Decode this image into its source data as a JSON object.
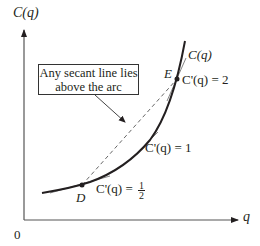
{
  "diagram": {
    "axes": {
      "y_label": "C(q)",
      "x_label": "q",
      "origin_label": "0"
    },
    "curve": {
      "label": "C(q)",
      "type": "convex cost curve"
    },
    "points": [
      {
        "name": "D",
        "slope_label_prefix": "C'(q) = ",
        "slope_num": "1",
        "slope_den": "2"
      },
      {
        "name": "E",
        "slope_label": "C'(q) = 2"
      }
    ],
    "tangents": [
      {
        "label": "C'(q) = 1"
      }
    ],
    "annotation": {
      "line1": "Any secant line lies",
      "line2": "above the arc"
    },
    "colors": {
      "ink": "#231f20",
      "dashed": "#555555",
      "tangent": "#777777"
    }
  }
}
